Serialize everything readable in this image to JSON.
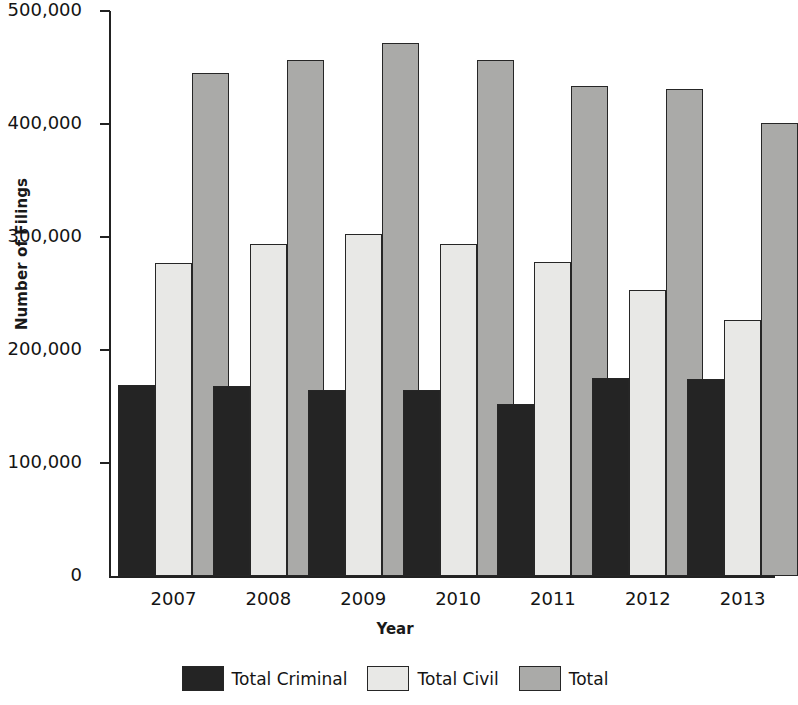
{
  "chart_data": {
    "type": "bar",
    "title": "",
    "xlabel": "Year",
    "ylabel": "Number of Filings",
    "categories": [
      "2007",
      "2008",
      "2009",
      "2010",
      "2011",
      "2012",
      "2013"
    ],
    "series": [
      {
        "name": "Total Criminal",
        "color": "#242424",
        "values": [
          169000,
          168000,
          165000,
          165000,
          152000,
          175000,
          174000
        ]
      },
      {
        "name": "Total Civil",
        "color": "#e8e8e6",
        "values": [
          277000,
          294000,
          303000,
          294000,
          278000,
          253000,
          227000
        ]
      },
      {
        "name": "Total",
        "color": "#aaaaa8",
        "values": [
          445000,
          457000,
          472000,
          457000,
          434000,
          431000,
          401000
        ]
      }
    ],
    "ylim": [
      0,
      500000
    ],
    "y_ticks": [
      0,
      100000,
      200000,
      300000,
      400000,
      500000
    ],
    "y_tick_labels": [
      "0",
      "100,000",
      "200,000",
      "300,000",
      "400,000",
      "500,000"
    ],
    "grid": false,
    "legend_position": "bottom"
  },
  "legend": {
    "items": [
      {
        "label": "Total Criminal"
      },
      {
        "label": "Total Civil"
      },
      {
        "label": "Total"
      }
    ]
  }
}
